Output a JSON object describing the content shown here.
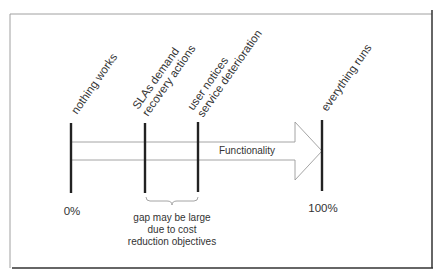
{
  "diagram": {
    "rotated_labels": [
      {
        "id": "nothing-works",
        "lines": [
          "nothing works"
        ]
      },
      {
        "id": "slas-demand",
        "lines": [
          "SLAs demand",
          "recovery actions"
        ]
      },
      {
        "id": "user-notices",
        "lines": [
          "user notices",
          "service deterioration"
        ]
      },
      {
        "id": "everything-runs",
        "lines": [
          "everything runs"
        ]
      }
    ],
    "arrow_label": "Functionality",
    "scale": {
      "start": "0%",
      "end": "100%"
    },
    "gap_note": [
      "gap may be large",
      "due to cost",
      "reduction objectives"
    ],
    "colors": {
      "bar": "#222222",
      "arrow_stroke": "#999999",
      "frame_light": "#a0a0a0",
      "frame_dark": "#333333",
      "text": "#333333"
    }
  }
}
